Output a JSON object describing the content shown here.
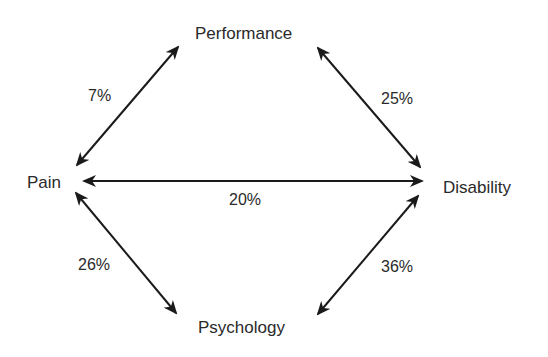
{
  "diagram": {
    "nodes": {
      "performance": "Performance",
      "pain": "Pain",
      "disability": "Disability",
      "psychology": "Psychology"
    },
    "edges": [
      {
        "from": "Pain",
        "to": "Performance",
        "label": "7%"
      },
      {
        "from": "Performance",
        "to": "Disability",
        "label": "25%"
      },
      {
        "from": "Pain",
        "to": "Disability",
        "label": "20%"
      },
      {
        "from": "Pain",
        "to": "Psychology",
        "label": "26%"
      },
      {
        "from": "Disability",
        "to": "Psychology",
        "label": "36%"
      }
    ],
    "line_color": "#1a1a1a"
  }
}
